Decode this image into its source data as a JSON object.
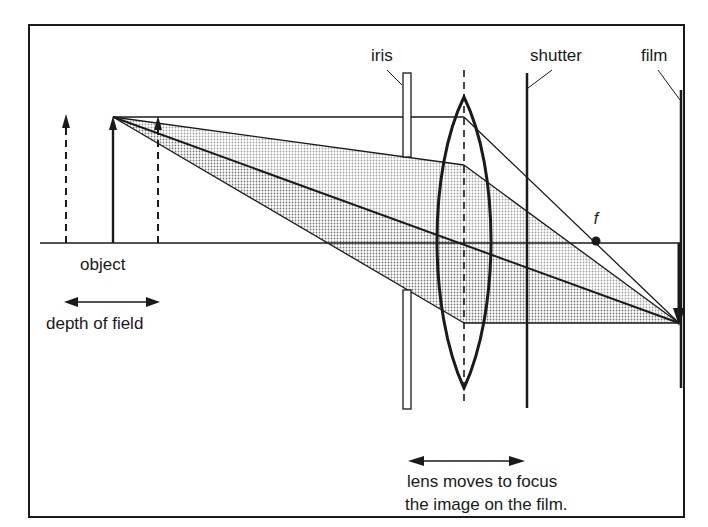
{
  "diagram": {
    "labels": {
      "iris": "iris",
      "shutter": "shutter",
      "film": "film",
      "focal_point": "f",
      "object": "object",
      "depth_of_field": "depth of field",
      "lens_caption_line1": "lens moves to focus",
      "lens_caption_line2": "the image on the film."
    },
    "colors": {
      "ink": "#1a1a1a",
      "stipple": "#c8c8c8",
      "background": "#ffffff"
    }
  }
}
